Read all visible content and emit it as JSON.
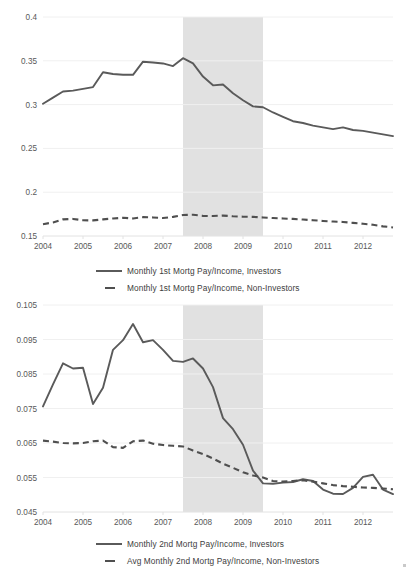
{
  "chart_data": [
    {
      "type": "line",
      "title": "",
      "xlabel": "",
      "ylabel": "",
      "ylim": [
        0.15,
        0.4
      ],
      "yticks": [
        "0.15",
        "0.2",
        "0.25",
        "0.3",
        "0.35",
        "0.4"
      ],
      "ytick_values": [
        0.15,
        0.2,
        0.25,
        0.3,
        0.35,
        0.4
      ],
      "xticks": [
        "2004",
        "2005",
        "2006",
        "2007",
        "2008",
        "2009",
        "2010",
        "2011",
        "2012"
      ],
      "xlim": [
        2004,
        2012.75
      ],
      "grid": true,
      "legend_position": "bottom",
      "annotations": [
        {
          "type": "shaded-band",
          "name": "recession-band",
          "x_start": 2007.5,
          "x_end": 2009.5,
          "color": "#dcdcdc"
        }
      ],
      "x": [
        2004.0,
        2004.25,
        2004.5,
        2004.75,
        2005.0,
        2005.25,
        2005.5,
        2005.75,
        2006.0,
        2006.25,
        2006.5,
        2006.75,
        2007.0,
        2007.25,
        2007.5,
        2007.75,
        2008.0,
        2008.25,
        2008.5,
        2008.75,
        2009.0,
        2009.25,
        2009.5,
        2009.75,
        2010.0,
        2010.25,
        2010.5,
        2010.75,
        2011.0,
        2011.25,
        2011.5,
        2011.75,
        2012.0,
        2012.25,
        2012.5,
        2012.75
      ],
      "series": [
        {
          "name": "Monthly 1st Mortg Pay/Income, Investors",
          "style": "solid",
          "color": "#5a5a5a",
          "values": [
            0.301,
            0.308,
            0.315,
            0.316,
            0.318,
            0.32,
            0.337,
            0.335,
            0.334,
            0.334,
            0.349,
            0.348,
            0.347,
            0.344,
            0.353,
            0.347,
            0.332,
            0.322,
            0.323,
            0.313,
            0.305,
            0.298,
            0.297,
            0.291,
            0.286,
            0.281,
            0.279,
            0.276,
            0.274,
            0.272,
            0.274,
            0.271,
            0.27,
            0.268,
            0.266,
            0.264
          ]
        },
        {
          "name": "Monthly 1st Mortg Pay/Income, Non-Investors",
          "style": "dashed",
          "color": "#4f4f4f",
          "values": [
            0.1635,
            0.1655,
            0.169,
            0.1695,
            0.168,
            0.1678,
            0.169,
            0.17,
            0.1708,
            0.17,
            0.1715,
            0.1712,
            0.1705,
            0.1718,
            0.174,
            0.1742,
            0.173,
            0.1728,
            0.1733,
            0.1725,
            0.172,
            0.1718,
            0.1712,
            0.1705,
            0.17,
            0.1695,
            0.1688,
            0.168,
            0.1672,
            0.1665,
            0.166,
            0.165,
            0.164,
            0.1628,
            0.161,
            0.1598
          ]
        }
      ]
    },
    {
      "type": "line",
      "title": "",
      "xlabel": "",
      "ylabel": "",
      "ylim": [
        0.045,
        0.105
      ],
      "yticks": [
        "0.045",
        "0.055",
        "0.065",
        "0.075",
        "0.085",
        "0.095",
        "0.105"
      ],
      "ytick_values": [
        0.045,
        0.055,
        0.065,
        0.075,
        0.085,
        0.095,
        0.105
      ],
      "xticks": [
        "2004",
        "2005",
        "2006",
        "2007",
        "2008",
        "2009",
        "2010",
        "2011",
        "2012"
      ],
      "xlim": [
        2004,
        2012.75
      ],
      "grid": true,
      "legend_position": "bottom",
      "annotations": [
        {
          "type": "shaded-band",
          "name": "recession-band",
          "x_start": 2007.5,
          "x_end": 2009.5,
          "color": "#dcdcdc"
        }
      ],
      "x": [
        2004.0,
        2004.25,
        2004.5,
        2004.75,
        2005.0,
        2005.25,
        2005.5,
        2005.75,
        2006.0,
        2006.25,
        2006.5,
        2006.75,
        2007.0,
        2007.25,
        2007.5,
        2007.75,
        2008.0,
        2008.25,
        2008.5,
        2008.75,
        2009.0,
        2009.25,
        2009.5,
        2009.75,
        2010.0,
        2010.25,
        2010.5,
        2010.75,
        2011.0,
        2011.25,
        2011.5,
        2011.75,
        2012.0,
        2012.25,
        2012.5,
        2012.75
      ],
      "series": [
        {
          "name": "Monthly 2nd Mortg Pay/Income, Investors",
          "style": "solid",
          "color": "#5a5a5a",
          "values": [
            0.0756,
            0.082,
            0.0881,
            0.0866,
            0.0868,
            0.0763,
            0.081,
            0.092,
            0.0948,
            0.0995,
            0.0942,
            0.0948,
            0.092,
            0.0888,
            0.0885,
            0.0895,
            0.0866,
            0.0812,
            0.0722,
            0.069,
            0.0645,
            0.057,
            0.0533,
            0.0532,
            0.0535,
            0.0537,
            0.0545,
            0.054,
            0.0515,
            0.0503,
            0.0502,
            0.052,
            0.0552,
            0.0558,
            0.0515,
            0.0502
          ]
        },
        {
          "name": "Avg Monthly 2nd Mortg Pay/Income, Non-Investors",
          "style": "dashed",
          "color": "#4f4f4f",
          "values": [
            0.0657,
            0.0654,
            0.065,
            0.0649,
            0.065,
            0.0655,
            0.0657,
            0.0638,
            0.0636,
            0.0655,
            0.0657,
            0.0648,
            0.0644,
            0.0642,
            0.064,
            0.0628,
            0.0618,
            0.0605,
            0.059,
            0.0578,
            0.0565,
            0.0556,
            0.055,
            0.054,
            0.0538,
            0.054,
            0.0542,
            0.0538,
            0.0533,
            0.0528,
            0.0525,
            0.0523,
            0.0521,
            0.052,
            0.0518,
            0.0516
          ]
        }
      ]
    }
  ],
  "chart_top": {
    "legend": [
      {
        "label": "Monthly 1st Mortg Pay/Income, Investors",
        "style": "solid"
      },
      {
        "label": "Monthly 1st Mortg Pay/Income, Non-Investors",
        "style": "dashed"
      }
    ]
  },
  "chart_bottom": {
    "legend": [
      {
        "label": "Monthly 2nd Mortg Pay/Income, Investors",
        "style": "solid"
      },
      {
        "label": "Avg Monthly 2nd Mortg Pay/Income, Non-Investors",
        "style": "dashed"
      }
    ]
  },
  "colors": {
    "solid_series": "#5a5a5a",
    "dashed_series": "#4f4f4f",
    "recession_band": "#dcdcdc",
    "gridline": "#f0f0f0",
    "tick_text": "#595959"
  }
}
